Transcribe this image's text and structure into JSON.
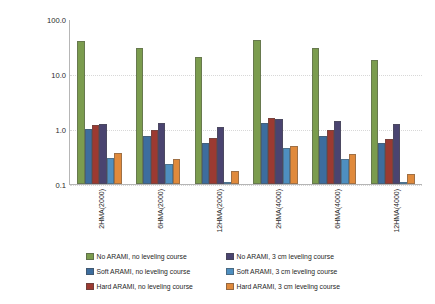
{
  "chart_data": {
    "type": "bar",
    "title": "",
    "xlabel": "",
    "ylabel": "Von Mises Stress @ bottom of overlay [MPa]",
    "yscale": "log",
    "ylim": [
      0.1,
      100.0
    ],
    "ytick_labels": [
      "100.0",
      "10.0",
      "1.0",
      "0.1"
    ],
    "ytick_values": [
      100.0,
      10.0,
      1.0,
      0.1
    ],
    "grid": false,
    "legend_position": "bottom",
    "categories": [
      "2HMA(2000)",
      "6HMA(2000)",
      "12HMA(2000)",
      "2HMA(4000)",
      "6HMA(4000)",
      "12HMA(4000)"
    ],
    "series": [
      {
        "name": "No ARAMI, no leveling course",
        "color": "#7b9c4e",
        "values": [
          40.0,
          30.0,
          20.0,
          42.0,
          30.0,
          18.0
        ]
      },
      {
        "name": "Soft ARAMI, no leveling course",
        "color": "#3d6d9e",
        "values": [
          1.0,
          0.75,
          0.55,
          1.3,
          0.75,
          0.55
        ]
      },
      {
        "name": "Hard ARAMI, no leveling course",
        "color": "#9c3a31",
        "values": [
          1.2,
          0.95,
          0.7,
          1.6,
          0.95,
          0.65
        ]
      },
      {
        "name": "No ARAMI, 3 cm leveling course",
        "color": "#4a4470",
        "values": [
          1.25,
          1.3,
          1.1,
          1.55,
          1.4,
          1.25
        ]
      },
      {
        "name": "Soft ARAMI, 3 cm leveling course",
        "color": "#4e8fc0",
        "values": [
          0.3,
          0.23,
          0.11,
          0.45,
          0.28,
          0.105
        ]
      },
      {
        "name": "Hard ARAMI, 3 cm leveling course",
        "color": "#e08a3c",
        "values": [
          0.37,
          0.28,
          0.17,
          0.5,
          0.35,
          0.15
        ]
      }
    ]
  }
}
